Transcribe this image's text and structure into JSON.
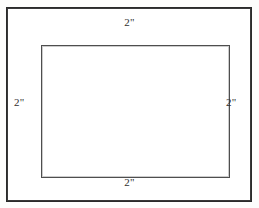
{
  "figure": {
    "kind": "geometry-diagram",
    "background_color": "#fdfdfc",
    "interior_color": "#ffffff"
  },
  "shapes": {
    "outer_rectangle": {
      "name": "outer-rectangle",
      "stroke_color": "#2b2b2b",
      "stroke_width_px": 2,
      "fill": "#ffffff"
    },
    "inner_rectangle": {
      "name": "inner-rectangle",
      "stroke_color": "#4e4e4e",
      "stroke_width_px": 1,
      "fill": "#ffffff"
    }
  },
  "labels": {
    "top": "2\"",
    "right": "2\"",
    "bottom": "2\"",
    "left": "2\"",
    "text_color": "#2f2f2f"
  }
}
